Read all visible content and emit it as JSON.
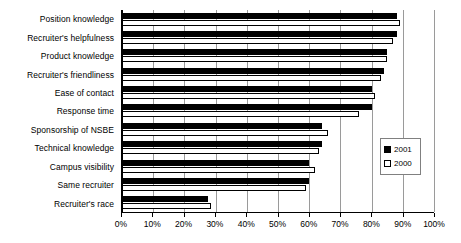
{
  "chart_data": {
    "type": "bar",
    "orientation": "horizontal",
    "title": "",
    "xlabel": "",
    "ylabel": "",
    "xlim": [
      0,
      100
    ],
    "xtick_labels": [
      "0%",
      "10%",
      "20%",
      "30%",
      "40%",
      "50%",
      "60%",
      "70%",
      "80%",
      "90%",
      "100%"
    ],
    "xtick_values": [
      0,
      10,
      20,
      30,
      40,
      50,
      60,
      70,
      80,
      90,
      100
    ],
    "grid": true,
    "legend_position": "right-middle",
    "categories": [
      "Position knowledge",
      "Recruiter's helpfulness",
      "Product knowledge",
      "Recruiter's friendliness",
      "Ease of contact",
      "Response time",
      "Sponsorship of NSBE",
      "Technical knowledge",
      "Campus visibility",
      "Same recruiter",
      "Recruiter's race"
    ],
    "series": [
      {
        "name": "2001",
        "color": "#000000",
        "values": [
          88,
          88,
          85,
          84,
          80,
          80,
          64,
          64,
          60,
          60,
          27.5
        ]
      },
      {
        "name": "2000",
        "color": "#ffffff",
        "values": [
          89,
          87,
          85,
          83,
          81,
          76,
          66,
          63,
          62,
          59,
          28.5
        ]
      }
    ]
  },
  "legend": {
    "entries": [
      {
        "label": "2001",
        "swatch": "filled"
      },
      {
        "label": "2000",
        "swatch": "hollow"
      }
    ]
  }
}
